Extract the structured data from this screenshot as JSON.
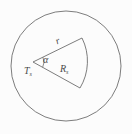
{
  "figure": {
    "background_color": "#fcfcfc",
    "stroke_color": "#6e6e6e",
    "text_color": "#4a4a4a"
  },
  "geometry": {
    "outer_circle": {
      "cx": 66,
      "cy": 66,
      "r": 55
    },
    "sector": {
      "apex_x": 33,
      "apex_y": 62,
      "arc_start_x": 82,
      "arc_start_y": 38,
      "arc_end_x": 80,
      "arc_end_y": 88,
      "arc_radius": 52
    },
    "angle_arc": {
      "cx": 33,
      "cy": 62,
      "r": 11
    }
  },
  "labels": {
    "radius": {
      "base": "r",
      "sub": ""
    },
    "angle": {
      "base": "α",
      "sub": ""
    },
    "apex_point": {
      "base": "T",
      "sub": "s"
    },
    "sector_region": {
      "base": "R",
      "sub": "s"
    }
  }
}
